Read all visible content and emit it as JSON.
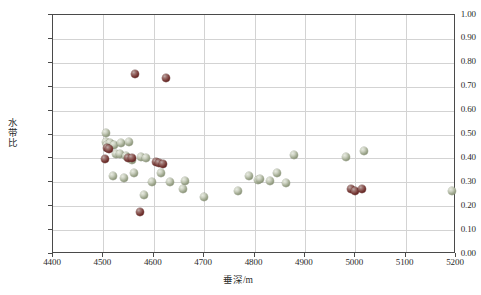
{
  "chart_data": {
    "type": "scatter",
    "title": "",
    "xlabel": "垂深/m",
    "ylabel": "水带比",
    "xlim": [
      4400,
      5200
    ],
    "ylim": [
      0.0,
      1.0
    ],
    "xticks": [
      4400,
      4500,
      4600,
      4700,
      4800,
      4900,
      5000,
      5100,
      5200
    ],
    "xticklabels": [
      "4400",
      "4500",
      "4600",
      "4700",
      "4800",
      "4900",
      "5000",
      "5100",
      "5200"
    ],
    "yticks": [
      0.0,
      0.1,
      0.2,
      0.3,
      0.4,
      0.5,
      0.6,
      0.7,
      0.8,
      0.9,
      1.0
    ],
    "yticklabels": [
      "0.00",
      "0.10",
      "0.20",
      "0.30",
      "0.40",
      "0.50",
      "0.60",
      "0.70",
      "0.80",
      "0.90",
      "1.00"
    ],
    "grid": true,
    "legend": false,
    "marker_style": "3d-sphere",
    "marker_size_px": 8,
    "colors": {
      "series_0": "#9aa389",
      "series_1": "#70312e",
      "axis": "#4a4a4a",
      "grid": "#d3d3d3",
      "background": "#ffffff",
      "text": "#2b2b2b"
    },
    "series": [
      {
        "name": "series-light",
        "color": "#9aa389",
        "points": [
          [
            4505,
            0.505
          ],
          [
            4506,
            0.47
          ],
          [
            4508,
            0.455
          ],
          [
            4513,
            0.465
          ],
          [
            4521,
            0.455
          ],
          [
            4535,
            0.465
          ],
          [
            4551,
            0.47
          ],
          [
            4526,
            0.42
          ],
          [
            4533,
            0.418
          ],
          [
            4545,
            0.41
          ],
          [
            4556,
            0.395
          ],
          [
            4575,
            0.405
          ],
          [
            4584,
            0.4
          ],
          [
            4520,
            0.325
          ],
          [
            4540,
            0.32
          ],
          [
            4561,
            0.34
          ],
          [
            4614,
            0.34
          ],
          [
            4596,
            0.3
          ],
          [
            4633,
            0.3
          ],
          [
            4663,
            0.305
          ],
          [
            4658,
            0.27
          ],
          [
            4580,
            0.245
          ],
          [
            4700,
            0.24
          ],
          [
            4768,
            0.265
          ],
          [
            4790,
            0.325
          ],
          [
            4806,
            0.31
          ],
          [
            4811,
            0.312
          ],
          [
            4830,
            0.305
          ],
          [
            4845,
            0.34
          ],
          [
            4878,
            0.415
          ],
          [
            4862,
            0.295
          ],
          [
            4982,
            0.405
          ],
          [
            5018,
            0.43
          ],
          [
            5192,
            0.265
          ]
        ]
      },
      {
        "name": "series-dark",
        "color": "#70312e",
        "points": [
          [
            4562,
            0.755
          ],
          [
            4625,
            0.735
          ],
          [
            4508,
            0.445
          ],
          [
            4512,
            0.44
          ],
          [
            4504,
            0.398
          ],
          [
            4549,
            0.4
          ],
          [
            4556,
            0.402
          ],
          [
            4604,
            0.385
          ],
          [
            4610,
            0.382
          ],
          [
            4618,
            0.378
          ],
          [
            4573,
            0.175
          ],
          [
            4992,
            0.272
          ],
          [
            4999,
            0.262
          ],
          [
            5013,
            0.272
          ]
        ]
      }
    ]
  }
}
